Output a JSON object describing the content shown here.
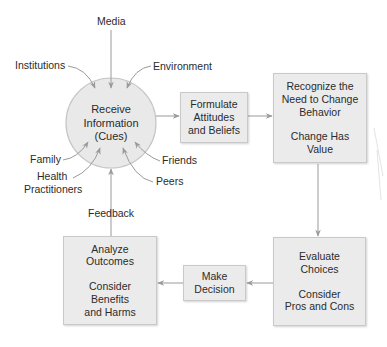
{
  "diagram": {
    "title": "",
    "center_node": {
      "lines": [
        "Receive",
        "Information",
        "(Cues)"
      ]
    },
    "influences": {
      "media": "Media",
      "institutions": "Institutions",
      "environment": "Environment",
      "family": "Family",
      "health_practitioners": [
        "Health",
        "Practitioners"
      ],
      "friends": "Friends",
      "peers": "Peers"
    },
    "feedback_label": "Feedback",
    "steps": {
      "formulate": {
        "lines": [
          "Formulate",
          "Attitudes",
          "and Beliefs"
        ]
      },
      "recognize": {
        "lines": [
          "Recognize the",
          "Need to Change",
          "Behavior"
        ],
        "sub_lines": [
          "Change Has",
          "Value"
        ]
      },
      "evaluate": {
        "lines": [
          "Evaluate",
          "Choices"
        ],
        "sub_lines": [
          "Consider",
          "Pros and Cons"
        ]
      },
      "decide": {
        "lines": [
          "Make",
          "Decision"
        ]
      },
      "analyze": {
        "lines": [
          "Analyze",
          "Outcomes"
        ],
        "sub_lines": [
          "Consider",
          "Benefits",
          "and Harms"
        ]
      }
    },
    "flow": [
      [
        "Receive Information (Cues)",
        "Formulate Attitudes and Beliefs"
      ],
      [
        "Formulate Attitudes and Beliefs",
        "Recognize the Need to Change Behavior"
      ],
      [
        "Recognize the Need to Change Behavior",
        "Evaluate Choices"
      ],
      [
        "Evaluate Choices",
        "Make Decision"
      ],
      [
        "Make Decision",
        "Analyze Outcomes"
      ],
      [
        "Analyze Outcomes",
        "Receive Information (Cues)"
      ]
    ],
    "colors": {
      "box_fill": "#ebebeb",
      "circle_fill": "#e9e9e9",
      "arrow": "#9a9a9a",
      "text": "#2b2b2b"
    }
  }
}
